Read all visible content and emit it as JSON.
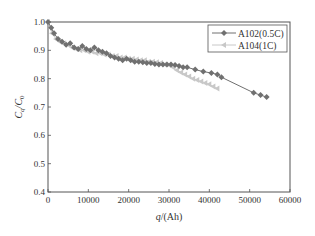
{
  "chart_data": {
    "type": "line",
    "title": "",
    "xlabel": "q/(Ah)",
    "ylabel": "Cq/C0",
    "xlim": [
      0,
      60000
    ],
    "ylim": [
      0.4,
      1.0
    ],
    "xticks": [
      "0",
      "10000",
      "20000",
      "30000",
      "40000",
      "50000",
      "60000"
    ],
    "yticks": [
      "0.4",
      "0.5",
      "0.6",
      "0.7",
      "0.8",
      "0.9",
      "1.0"
    ],
    "grid": false,
    "legend_position": "upper right",
    "series": [
      {
        "name": "A102(0.5C)",
        "color": "#707070",
        "marker": "diamond",
        "x": [
          0,
          800,
          1500,
          2500,
          3500,
          4500,
          5500,
          6500,
          7500,
          8500,
          9500,
          10500,
          11500,
          12500,
          13500,
          14500,
          15500,
          16500,
          17500,
          18500,
          19500,
          20500,
          21500,
          22500,
          23500,
          24500,
          25500,
          26500,
          27500,
          28500,
          29500,
          30500,
          31500,
          32500,
          33500,
          34500,
          36500,
          38500,
          40500,
          42000,
          43000,
          51000,
          52700,
          54200
        ],
        "values": [
          1.0,
          0.98,
          0.96,
          0.94,
          0.93,
          0.92,
          0.925,
          0.91,
          0.905,
          0.915,
          0.905,
          0.9,
          0.91,
          0.9,
          0.895,
          0.89,
          0.88,
          0.875,
          0.87,
          0.865,
          0.87,
          0.865,
          0.86,
          0.86,
          0.858,
          0.855,
          0.855,
          0.852,
          0.85,
          0.85,
          0.85,
          0.85,
          0.848,
          0.845,
          0.84,
          0.84,
          0.832,
          0.825,
          0.82,
          0.815,
          0.805,
          0.75,
          0.742,
          0.735
        ]
      },
      {
        "name": "A104(1C)",
        "color": "#c8c8c8",
        "marker": "triangle-left",
        "x": [
          0,
          1000,
          2000,
          3000,
          4000,
          5000,
          6000,
          7000,
          8000,
          9000,
          10000,
          11000,
          12000,
          13000,
          14000,
          15000,
          16000,
          17000,
          18000,
          19000,
          20000,
          21000,
          22000,
          23000,
          24000,
          25000,
          26000,
          27000,
          28000,
          29000,
          30000,
          31000,
          32000,
          33000,
          34000,
          35000,
          36000,
          37000,
          38000,
          39000,
          40000,
          41000,
          42000
        ],
        "values": [
          1.0,
          0.96,
          0.94,
          0.93,
          0.925,
          0.92,
          0.91,
          0.905,
          0.9,
          0.9,
          0.895,
          0.895,
          0.89,
          0.89,
          0.885,
          0.885,
          0.88,
          0.88,
          0.875,
          0.875,
          0.87,
          0.87,
          0.868,
          0.865,
          0.865,
          0.86,
          0.86,
          0.858,
          0.855,
          0.85,
          0.848,
          0.84,
          0.83,
          0.822,
          0.815,
          0.808,
          0.8,
          0.795,
          0.79,
          0.785,
          0.78,
          0.772,
          0.765
        ]
      }
    ]
  },
  "legend": {
    "items": [
      {
        "label": "A102(0.5C)"
      },
      {
        "label": "A104(1C)"
      }
    ]
  },
  "axes": {
    "xlabel_italic": "q",
    "xlabel_rest": "/(Ah)",
    "ylabel_main": "C",
    "ylabel_sub1": "q",
    "ylabel_slash": "/C",
    "ylabel_sub2": "0"
  }
}
